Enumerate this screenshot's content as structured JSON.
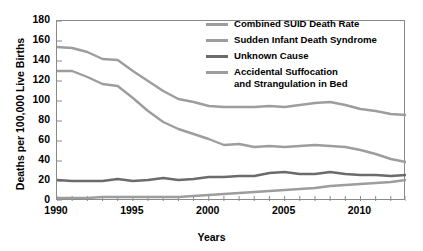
{
  "chart_data": {
    "type": "line",
    "title": "",
    "xlabel": "Years",
    "ylabel": "Deaths per 100,000 Live Births",
    "xlim": [
      1990,
      2013
    ],
    "ylim": [
      0,
      180
    ],
    "ytick_step": 20,
    "yticks": [
      0,
      20,
      40,
      60,
      80,
      100,
      120,
      140,
      160,
      180
    ],
    "xticks": [
      1990,
      1991,
      1992,
      1993,
      1994,
      1995,
      1996,
      1997,
      1998,
      1999,
      2000,
      2001,
      2002,
      2003,
      2004,
      2005,
      2006,
      2007,
      2008,
      2009,
      2010,
      2011,
      2012,
      2013
    ],
    "xtick_labels_shown": [
      "1990",
      "1995",
      "2000",
      "2005",
      "2010"
    ],
    "grid": false,
    "legend_position": "top-right",
    "x": [
      1990,
      1991,
      1992,
      1993,
      1994,
      1995,
      1996,
      1997,
      1998,
      1999,
      2000,
      2001,
      2002,
      2003,
      2004,
      2005,
      2006,
      2007,
      2008,
      2009,
      2010,
      2011,
      2012,
      2013
    ],
    "series": [
      {
        "name": "Combined SUID Death Rate",
        "color": "#9d9d9d",
        "values": [
          154,
          153,
          149,
          142,
          141,
          130,
          120,
          110,
          102,
          99,
          95,
          94,
          94,
          94,
          95,
          94,
          96,
          98,
          99,
          96,
          92,
          90,
          87,
          86
        ]
      },
      {
        "name": "Sudden Infant Death Syndrome",
        "color": "#9d9d9d",
        "values": [
          130,
          130,
          124,
          117,
          115,
          103,
          90,
          79,
          72,
          67,
          62,
          56,
          57,
          54,
          55,
          54,
          55,
          56,
          55,
          54,
          51,
          47,
          42,
          39
        ]
      },
      {
        "name": "Unknown Cause",
        "color": "#6b6b6b",
        "values": [
          21,
          20,
          20,
          20,
          22,
          20,
          21,
          23,
          21,
          22,
          24,
          24,
          25,
          25,
          28,
          29,
          27,
          27,
          29,
          27,
          26,
          26,
          25,
          26
        ]
      },
      {
        "name": "Accidental Suffocation and Strangulation in Bed",
        "color": "#9d9d9d",
        "values": [
          3,
          3,
          3,
          4,
          4,
          4,
          4,
          4,
          4,
          5,
          6,
          7,
          8,
          9,
          10,
          11,
          12,
          13,
          15,
          16,
          17,
          18,
          19,
          21
        ]
      }
    ]
  },
  "legend": {
    "entries": [
      "Combined SUID Death Rate",
      "Sudden Infant Death Syndrome",
      "Unknown Cause",
      "Accidental Suffocation",
      "and Strangulation in Bed"
    ]
  }
}
